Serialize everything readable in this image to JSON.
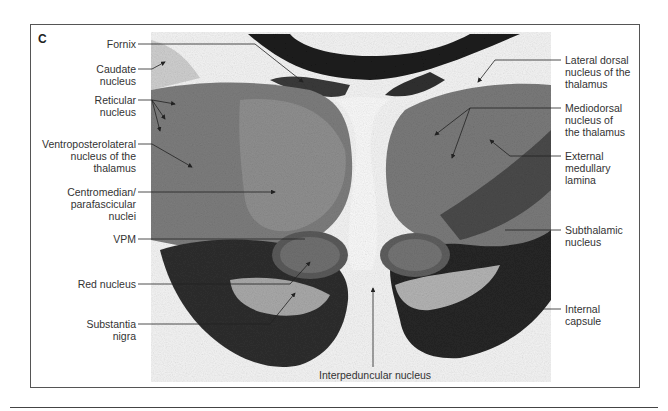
{
  "figure": {
    "panel_letter": "C",
    "labels_left": [
      {
        "id": "fornix",
        "text": "Fornix"
      },
      {
        "id": "caudate",
        "text": "Caudate\nnucleus"
      },
      {
        "id": "reticular",
        "text": "Reticular\nnucleus"
      },
      {
        "id": "vpl",
        "text": "Ventroposterolateral\nnucleus of the\nthalamus"
      },
      {
        "id": "cm-pf",
        "text": "Centromedian/\nparafascicular\nnuclei"
      },
      {
        "id": "vpm",
        "text": "VPM"
      },
      {
        "id": "red",
        "text": "Red nucleus"
      },
      {
        "id": "sn",
        "text": "Substantia\nnigra"
      }
    ],
    "labels_right": [
      {
        "id": "ld",
        "text": "Lateral dorsal\nnucleus of the\nthalamus"
      },
      {
        "id": "md",
        "text": "Mediodorsal\nnucleus of\nthe thalamus"
      },
      {
        "id": "eml",
        "text": "External\nmedullary\nlamina"
      },
      {
        "id": "stn",
        "text": "Subthalamic\nnucleus"
      },
      {
        "id": "ic",
        "text": "Internal\ncapsule"
      }
    ],
    "labels_bottom": [
      {
        "id": "ipn",
        "text": "Interpeduncular nucleus"
      }
    ]
  }
}
